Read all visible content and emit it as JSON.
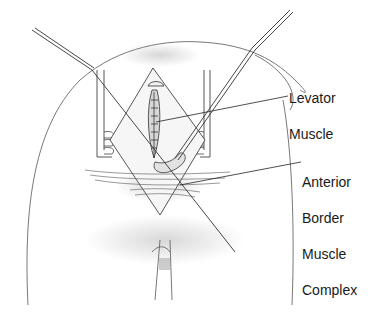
{
  "figure": {
    "type": "medical-illustration",
    "style": "pencil line drawing",
    "labels": [
      {
        "id": "levator",
        "lines": [
          "Levator",
          "Muscle"
        ]
      },
      {
        "id": "anterior",
        "lines": [
          "Anterior",
          "Border",
          "Muscle",
          "Complex"
        ]
      }
    ],
    "colors": {
      "ink": "#3a3a3a",
      "shading": "#b8b8b8",
      "background": "#ffffff"
    }
  }
}
